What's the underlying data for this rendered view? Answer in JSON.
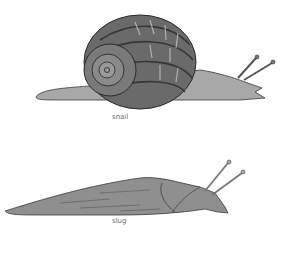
{
  "figures": [
    {
      "name": "snail",
      "caption": "snail"
    },
    {
      "name": "slug",
      "caption": "slug"
    }
  ],
  "colors": {
    "ink": "#3a3a3a",
    "body": "#9a9a9a",
    "shell_dark": "#4a4a4a",
    "caption": "#6a6a6a"
  }
}
